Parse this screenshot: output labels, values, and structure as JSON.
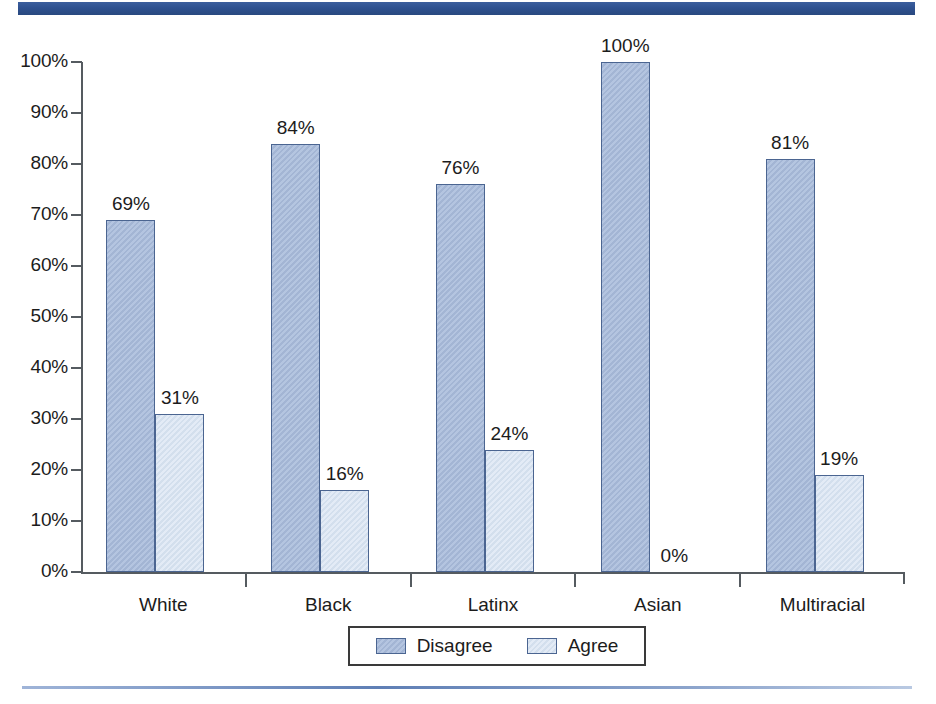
{
  "decor": {
    "top_rule_color": "#2f5190",
    "bottom_rule_color": "#6f8cbd"
  },
  "chart_data": {
    "type": "bar",
    "title": "",
    "subtitle": "",
    "xlabel": "",
    "ylabel": "",
    "ylim": [
      0,
      100
    ],
    "y_ticks": [
      "0%",
      "10%",
      "20%",
      "30%",
      "40%",
      "50%",
      "60%",
      "70%",
      "80%",
      "90%",
      "100%"
    ],
    "y_tick_values": [
      0,
      10,
      20,
      30,
      40,
      50,
      60,
      70,
      80,
      90,
      100
    ],
    "grid": false,
    "legend_position": "bottom-center",
    "categories": [
      "White",
      "Black",
      "Latinx",
      "Asian",
      "Multiracial"
    ],
    "series": [
      {
        "name": "Disagree",
        "color": "#a8bbdb",
        "values": [
          69,
          84,
          76,
          100,
          81
        ],
        "labels": [
          "69%",
          "84%",
          "76%",
          "100%",
          "81%"
        ]
      },
      {
        "name": "Agree",
        "color": "#d7e3f2",
        "values": [
          31,
          16,
          24,
          0,
          19
        ],
        "labels": [
          "31%",
          "16%",
          "24%",
          "0%",
          "19%"
        ]
      }
    ]
  },
  "legend": {
    "items": [
      {
        "label": "Disagree",
        "swatch": "disagree"
      },
      {
        "label": "Agree",
        "swatch": "agree"
      }
    ]
  }
}
